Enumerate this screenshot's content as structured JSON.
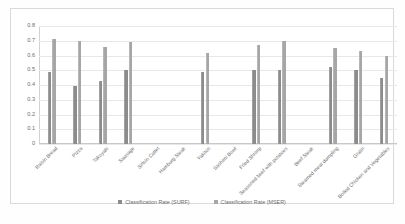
{
  "chart_data": {
    "type": "bar",
    "title": "",
    "xlabel": "",
    "ylabel": "",
    "ylim": [
      0,
      0.8
    ],
    "ytick_step": 0.1,
    "grid": true,
    "legend_position": "bottom",
    "yticks": [
      "0",
      "0.1",
      "0.2",
      "0.3",
      "0.4",
      "0.5",
      "0.6",
      "0.7",
      "0.8"
    ],
    "categories": [
      "Raisin Bread",
      "Pizza",
      "Takoyaki",
      "Sausage",
      "Sirloin Cutlet",
      "Hamburg Steak",
      "Yakitori",
      "Sashimi Bowl",
      "Fried Shrimp",
      "Seasoned beef with potatoes",
      "Beef Steak",
      "Steamed meat dumpling",
      "Gratin",
      "Boiled Chicken and Vegetables"
    ],
    "series": [
      {
        "name": "Classification Rate (SURF)",
        "color": "#8c8c8c",
        "values": [
          0.49,
          0.39,
          0.43,
          0.5,
          null,
          null,
          0.49,
          null,
          0.5,
          0.5,
          null,
          0.52,
          0.5,
          0.45
        ]
      },
      {
        "name": "Classification Rate (MSER)",
        "color": "#a6a6a6",
        "values": [
          0.71,
          0.7,
          0.66,
          0.69,
          null,
          null,
          0.62,
          null,
          0.67,
          0.7,
          null,
          0.65,
          0.63,
          0.6
        ]
      }
    ]
  },
  "legend": {
    "items": [
      {
        "label": "Classification Rate (SURF)",
        "color": "#8c8c8c"
      },
      {
        "label": "Classification Rate (MSER)",
        "color": "#a6a6a6"
      }
    ]
  }
}
